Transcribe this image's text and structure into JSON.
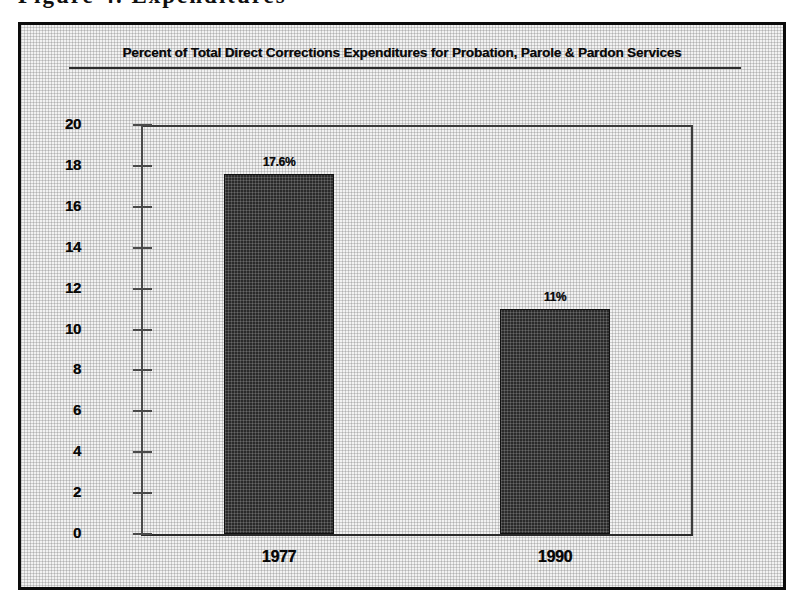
{
  "page": {
    "cut_off_text_top": "Figure 4. Expenditures"
  },
  "figure": {
    "title": "Percent of Total Direct Corrections Expenditures for Probation, Parole & Pardon Services"
  },
  "chart_data": {
    "type": "bar",
    "title": "Percent of Total Direct Corrections Expenditures for Probation, Parole & Pardon Services",
    "categories": [
      "1977",
      "1990"
    ],
    "values": [
      17.6,
      11
    ],
    "data_labels": [
      "17.6%",
      "11%"
    ],
    "xlabel": "",
    "ylabel": "",
    "ylim": [
      0,
      20
    ],
    "ytick_step": 2,
    "ytick_labels": [
      "20",
      "18",
      "16",
      "14",
      "12",
      "10",
      "8",
      "6",
      "4",
      "2",
      "0"
    ],
    "grid": false,
    "legend": false,
    "bar_color": "#2a2a2a",
    "plot_background": "#f2f2f2",
    "axis_color": "#3b3b3b"
  }
}
